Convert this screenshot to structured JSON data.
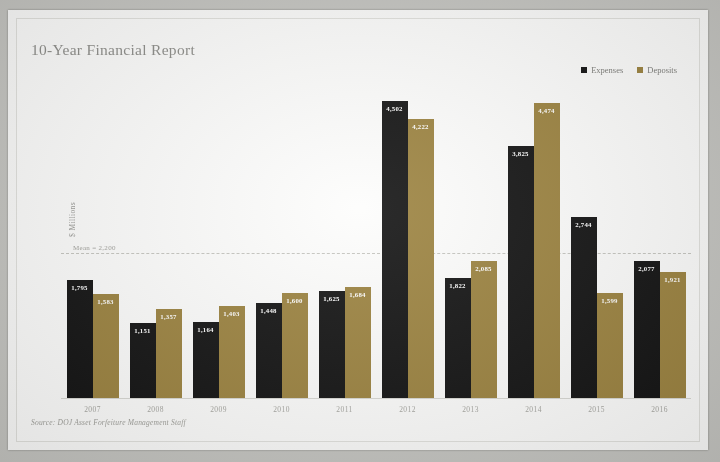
{
  "card": {
    "title": "10-Year Financial Report",
    "source_note": "Source: DOJ Asset Forfeiture Management Staff"
  },
  "legend": {
    "position": "top-right",
    "items": [
      {
        "label": "Expenses",
        "color": "#131313"
      },
      {
        "label": "Deposits",
        "color": "#9c8340"
      }
    ]
  },
  "axes": {
    "ylabel": "$ Millions",
    "mean_label": "Mean = 2,200"
  },
  "chart_data": {
    "type": "bar",
    "title": "10-Year Financial Report",
    "xlabel": "",
    "ylabel": "$ Millions",
    "ylim": [
      0,
      4800
    ],
    "grid": false,
    "legend_position": "top-right",
    "categories": [
      "2007",
      "2008",
      "2009",
      "2010",
      "2011",
      "2012",
      "2013",
      "2014",
      "2015",
      "2016"
    ],
    "series": [
      {
        "name": "Expenses",
        "color": "#131313",
        "values": [
          1795,
          1151,
          1164,
          1448,
          1625,
          4502,
          1822,
          3825,
          2744,
          2077
        ],
        "labels": [
          "1,795",
          "1,151",
          "1,164",
          "1,448",
          "1,625",
          "4,502",
          "1,822",
          "3,825",
          "2,744",
          "2,077"
        ]
      },
      {
        "name": "Deposits",
        "color": "#9c8340",
        "values": [
          1583,
          1357,
          1403,
          1600,
          1684,
          4222,
          2085,
          4474,
          1599,
          1921
        ],
        "labels": [
          "1,583",
          "1,357",
          "1,403",
          "1,600",
          "1,684",
          "4,222",
          "2,085",
          "4,474",
          "1,599",
          "1,921"
        ]
      }
    ],
    "annotations": [
      {
        "type": "hline",
        "label": "Mean = 2,200",
        "value": 2200,
        "style": "dashed"
      }
    ]
  }
}
